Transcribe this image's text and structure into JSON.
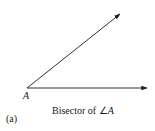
{
  "figure": {
    "panel_label": "(a)",
    "vertex_label": "A",
    "caption_prefix": "Bisector of ",
    "caption_angle_symbol": "∠",
    "caption_angle_var": "A",
    "colors": {
      "stroke": "#1a1a1a",
      "background": "#ffffff"
    },
    "rays": [
      {
        "name": "upper-ray",
        "from": [
          27,
          88
        ],
        "to": [
          120,
          14
        ]
      },
      {
        "name": "lower-ray",
        "from": [
          27,
          88
        ],
        "to": [
          147,
          88
        ]
      }
    ]
  }
}
